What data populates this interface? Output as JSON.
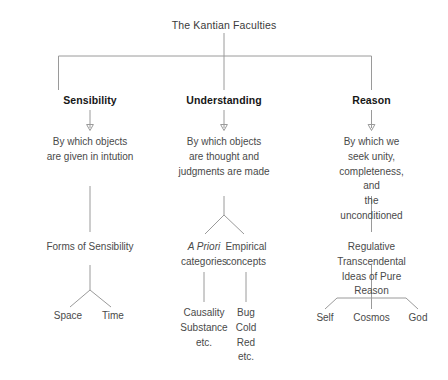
{
  "diagram": {
    "title": "The Kantian Faculties",
    "root": {
      "label": "The Kantian Faculties"
    },
    "branches": [
      {
        "id": "sensibility",
        "faculty": "Sensibility",
        "definition": "By which objects\nare given in intution",
        "group_heading": "Forms of Sensibility",
        "leaves": [
          "Space",
          "Time"
        ]
      },
      {
        "id": "understanding",
        "faculty": "Understanding",
        "definition": "By which objects\nare thought and\njudgments are made",
        "subgroups": [
          {
            "id": "a-priori-categories",
            "heading_italic": "A Priori",
            "heading_rest": "categories",
            "items": "Causality\nSubstance\netc."
          },
          {
            "id": "empirical-concepts",
            "heading_italic": "",
            "heading_rest": "Empirical\nconcepts",
            "items": "Bug\nCold\nRed\netc."
          }
        ]
      },
      {
        "id": "reason",
        "faculty": "Reason",
        "definition": "By which we seek unity,\ncompleteness, and\nthe unconditioned",
        "group_heading": "Regulative Transcendental\nIdeas of Pure Reason",
        "leaves": [
          "Self",
          "Cosmos",
          "God"
        ]
      }
    ]
  },
  "colors": {
    "background": "#ffffff",
    "line": "#9a9a9a",
    "text": "#4a4a4a",
    "heading_text": "#161616"
  }
}
